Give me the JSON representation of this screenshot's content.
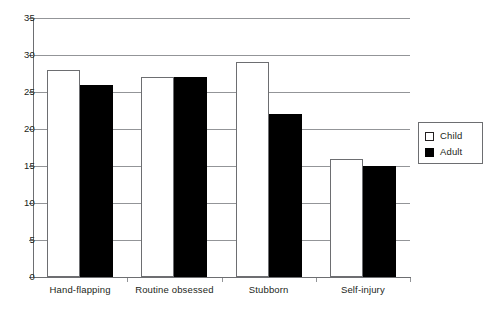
{
  "chart_data": {
    "type": "bar",
    "title": "",
    "subtitle": "",
    "xlabel": "",
    "ylabel": "",
    "categories": [
      "Hand-flapping",
      "Routine obsessed",
      "Stubborn",
      "Self-injury"
    ],
    "series": [
      {
        "name": "Child",
        "values": [
          28,
          27,
          29,
          16
        ],
        "color": "#ffffff"
      },
      {
        "name": "Adult",
        "values": [
          26,
          27,
          22,
          15
        ],
        "color": "#000000"
      }
    ],
    "ylim": [
      0,
      35
    ],
    "ytick_labels": [
      "0",
      "5",
      "10",
      "15",
      "20",
      "25",
      "30",
      "35"
    ],
    "ytick_values": [
      0,
      5,
      10,
      15,
      20,
      25,
      30,
      35
    ],
    "grid": "horizontal",
    "legend_position": "right",
    "legend_entries": [
      "Child",
      "Adult"
    ]
  },
  "legend": {
    "items": [
      {
        "label": "Child"
      },
      {
        "label": "Adult"
      }
    ]
  }
}
